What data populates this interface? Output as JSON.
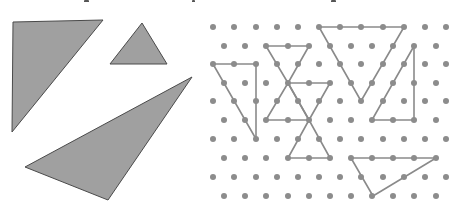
{
  "canvas": {
    "width": 456,
    "height": 219,
    "background": "#ffffff"
  },
  "caption": {
    "note": "",
    "descender_marks": [
      {
        "x": 84,
        "y": 0,
        "w": 5,
        "h": 3
      },
      {
        "x": 192,
        "y": 0,
        "w": 3,
        "h": 4
      },
      {
        "x": 331,
        "y": 0,
        "w": 5,
        "h": 3
      }
    ]
  },
  "colors": {
    "shape_fill": "#a0a0a0",
    "shape_stroke": "#4a4a4a",
    "dot": "#8c8c8c",
    "grid_line": "#8a8a8a"
  },
  "left_panel": {
    "label": "Solid triangles",
    "triangles": [
      {
        "name": "right-triangle-large",
        "points": [
          [
            13,
            22
          ],
          [
            103,
            20
          ],
          [
            12,
            132
          ]
        ]
      },
      {
        "name": "small-triangle",
        "points": [
          [
            142,
            23
          ],
          [
            110,
            64
          ],
          [
            167,
            64
          ]
        ]
      },
      {
        "name": "obtuse-triangle",
        "points": [
          [
            25,
            167
          ],
          [
            192,
            77
          ],
          [
            108,
            200
          ]
        ]
      }
    ]
  },
  "right_panel": {
    "label": "Isometric dot grid",
    "grid": {
      "rows_y": [
        27,
        46,
        64,
        83,
        101,
        120,
        139,
        158,
        177,
        196
      ],
      "even_row_x": [
        213,
        234,
        256,
        277,
        298,
        319,
        340,
        361,
        383,
        404,
        425,
        446
      ],
      "odd_row_x": [
        224,
        245,
        266,
        288,
        309,
        330,
        351,
        372,
        393,
        414,
        436
      ],
      "dot_radius": 3
    },
    "triangles": [
      {
        "name": "grid-triangle-left-right-angle",
        "points": [
          [
            213,
            64
          ],
          [
            256,
            64
          ],
          [
            256,
            139
          ]
        ]
      },
      {
        "name": "grid-triangle-hourglass-top",
        "points": [
          [
            266,
            46
          ],
          [
            309,
            46
          ],
          [
            288,
            83
          ]
        ]
      },
      {
        "name": "grid-triangle-hourglass-right",
        "points": [
          [
            288,
            83
          ],
          [
            330,
            83
          ],
          [
            309,
            120
          ]
        ]
      },
      {
        "name": "grid-triangle-hourglass-middle",
        "points": [
          [
            266,
            120
          ],
          [
            309,
            120
          ],
          [
            288,
            83
          ]
        ]
      },
      {
        "name": "grid-triangle-hourglass-bottom",
        "points": [
          [
            309,
            120
          ],
          [
            288,
            158
          ],
          [
            330,
            158
          ]
        ]
      },
      {
        "name": "grid-triangle-large-inverted",
        "points": [
          [
            319,
            27
          ],
          [
            404,
            27
          ],
          [
            361,
            101
          ]
        ]
      },
      {
        "name": "grid-triangle-right-tall",
        "points": [
          [
            414,
            46
          ],
          [
            414,
            120
          ],
          [
            372,
            120
          ]
        ]
      },
      {
        "name": "grid-triangle-bottom-obtuse",
        "points": [
          [
            351,
            158
          ],
          [
            436,
            158
          ],
          [
            373,
            196
          ]
        ]
      }
    ]
  }
}
